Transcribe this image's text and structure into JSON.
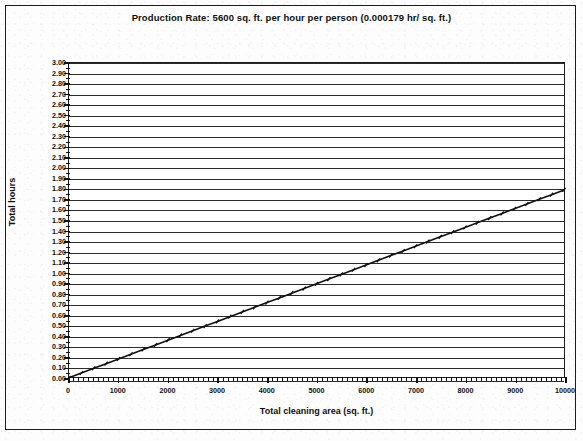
{
  "chart_data": {
    "type": "line",
    "title": "Production Rate: 5600 sq. ft. per hour per person (0.000179 hr/ sq. ft.)",
    "xlabel": "Total cleaning area (sq. ft.)",
    "ylabel": "Total hours",
    "xlim": [
      0,
      10000
    ],
    "ylim": [
      0,
      3.0
    ],
    "xtick_step": 1000,
    "ytick_step": 0.1,
    "x_minor_step": 100,
    "y_minor_step": 0.05,
    "grid": true,
    "legend": "none",
    "slope_hr_per_sqft": 0.000179,
    "xticks": [
      "0",
      "1000",
      "2000",
      "3000",
      "4000",
      "5000",
      "6000",
      "7000",
      "8000",
      "9000",
      "10000"
    ],
    "yticks": [
      "3.00",
      "2.90",
      "2.80",
      "2.70",
      "2.60",
      "2.50",
      "2.40",
      "2.30",
      "2.20",
      "2.10",
      "2.00",
      "1.90",
      "1.80",
      "1.70",
      "1.60",
      "1.50",
      "1.40",
      "1.30",
      "1.20",
      "1.10",
      "1.00",
      "0.90",
      "0.80",
      "0.70",
      "0.60",
      "0.50",
      "0.40",
      "0.30",
      "0.20",
      "0.10",
      "0.00"
    ],
    "series": [
      {
        "name": "Total hours",
        "marker": "tick",
        "x": [
          0,
          250,
          500,
          750,
          1000,
          1250,
          1500,
          1750,
          2000,
          2250,
          2500,
          2750,
          3000,
          3250,
          3500,
          3750,
          4000,
          4250,
          4500,
          4750,
          5000,
          5250,
          5500,
          5750,
          6000,
          6250,
          6500,
          6750,
          7000,
          7250,
          7500,
          7750,
          8000,
          8250,
          8500,
          8750,
          9000,
          9250,
          9500,
          9750,
          10000
        ],
        "values": [
          0.0,
          0.045,
          0.09,
          0.134,
          0.179,
          0.224,
          0.269,
          0.313,
          0.358,
          0.403,
          0.448,
          0.492,
          0.537,
          0.582,
          0.627,
          0.671,
          0.716,
          0.761,
          0.806,
          0.85,
          0.895,
          0.94,
          0.985,
          1.029,
          1.074,
          1.119,
          1.164,
          1.208,
          1.253,
          1.298,
          1.343,
          1.387,
          1.432,
          1.477,
          1.522,
          1.566,
          1.611,
          1.656,
          1.701,
          1.745,
          1.79
        ]
      }
    ]
  },
  "colors": {
    "ink": "#111111",
    "paper": "#fdfdfd",
    "grid": "#2b2b2b"
  }
}
